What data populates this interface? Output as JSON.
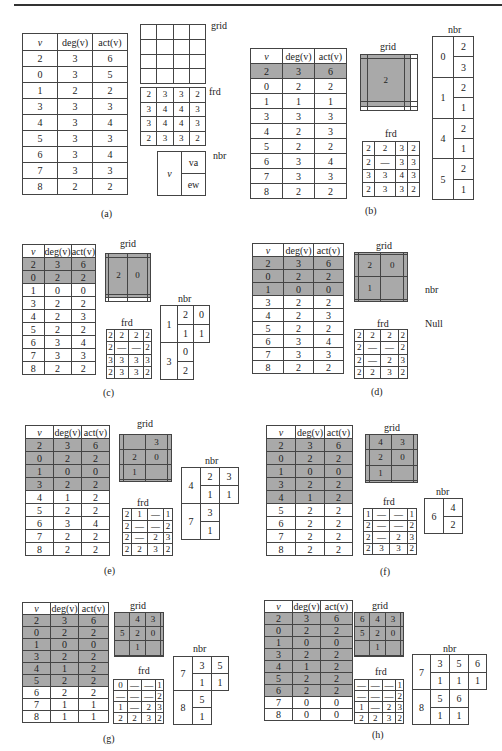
{
  "labels": {
    "grid": "grid",
    "frd": "frd",
    "nbr": "nbr",
    "null_text": "Null"
  },
  "table_header": {
    "v": "v",
    "deg": "deg(v)",
    "act": "act(v)"
  },
  "panels": {
    "a": {
      "caption": "(a)",
      "rows": [
        [
          "2",
          "3",
          "6"
        ],
        [
          "0",
          "3",
          "5"
        ],
        [
          "1",
          "2",
          "2"
        ],
        [
          "3",
          "3",
          "3"
        ],
        [
          "4",
          "3",
          "4"
        ],
        [
          "5",
          "3",
          "3"
        ],
        [
          "6",
          "3",
          "4"
        ],
        [
          "7",
          "3",
          "3"
        ],
        [
          "8",
          "2",
          "2"
        ]
      ],
      "selected_rows": 0,
      "grid": [
        [
          "",
          "",
          "",
          ""
        ],
        [
          "",
          "",
          "",
          ""
        ],
        [
          "",
          "",
          "",
          ""
        ],
        [
          "",
          "",
          "",
          ""
        ]
      ],
      "frd": [
        [
          "2",
          "3",
          "3",
          "2"
        ],
        [
          "3",
          "4",
          "4",
          "3"
        ],
        [
          "3",
          "4",
          "4",
          "3"
        ],
        [
          "2",
          "3",
          "3",
          "2"
        ]
      ],
      "nbr_legend": {
        "v": "v",
        "va": "va",
        "ew": "ew"
      }
    },
    "b": {
      "caption": "(b)",
      "rows": [
        [
          "2",
          "3",
          "6"
        ],
        [
          "0",
          "2",
          "2"
        ],
        [
          "1",
          "1",
          "1"
        ],
        [
          "3",
          "3",
          "3"
        ],
        [
          "4",
          "2",
          "3"
        ],
        [
          "5",
          "2",
          "2"
        ],
        [
          "6",
          "3",
          "4"
        ],
        [
          "7",
          "3",
          "3"
        ],
        [
          "8",
          "2",
          "2"
        ]
      ],
      "selected_rows": 1,
      "grid": [
        [
          "",
          "",
          "",
          ""
        ],
        [
          "",
          "2",
          "",
          ""
        ],
        [
          "",
          "",
          "",
          ""
        ],
        [
          "",
          "",
          "",
          ""
        ]
      ],
      "frd": [
        [
          "2",
          "2",
          "3",
          "2"
        ],
        [
          "2",
          "—",
          "3",
          "3"
        ],
        [
          "3",
          "3",
          "4",
          "3"
        ],
        [
          "2",
          "3",
          "3",
          "2"
        ]
      ],
      "nbr": [
        {
          "v": "0",
          "va": [
            "2"
          ],
          "ew": [
            "3"
          ]
        },
        {
          "v": "1",
          "va": [
            "2"
          ],
          "ew": [
            "1"
          ]
        },
        {
          "v": "4",
          "va": [
            "2"
          ],
          "ew": [
            "1"
          ]
        },
        {
          "v": "5",
          "va": [
            "2"
          ],
          "ew": [
            "1"
          ]
        }
      ]
    },
    "c": {
      "caption": "(c)",
      "rows": [
        [
          "2",
          "3",
          "6"
        ],
        [
          "0",
          "2",
          "2"
        ],
        [
          "1",
          "0",
          "0"
        ],
        [
          "3",
          "2",
          "2"
        ],
        [
          "4",
          "2",
          "3"
        ],
        [
          "5",
          "2",
          "2"
        ],
        [
          "6",
          "3",
          "4"
        ],
        [
          "7",
          "3",
          "3"
        ],
        [
          "8",
          "2",
          "2"
        ]
      ],
      "selected_rows": 2,
      "grid": [
        [
          "",
          "",
          "",
          ""
        ],
        [
          "",
          "2",
          "0",
          ""
        ],
        [
          "",
          "",
          "",
          ""
        ],
        [
          "",
          "",
          "",
          ""
        ]
      ],
      "frd": [
        [
          "2",
          "2",
          "2",
          "2"
        ],
        [
          "2",
          "—",
          "—",
          "2"
        ],
        [
          "3",
          "3",
          "3",
          "3"
        ],
        [
          "2",
          "3",
          "3",
          "2"
        ]
      ],
      "nbr": [
        {
          "v": "1",
          "va": [
            "2",
            "0"
          ],
          "ew": [
            "1",
            "1"
          ]
        },
        {
          "v": "3",
          "va": [
            "0"
          ],
          "ew": [
            "2"
          ]
        }
      ]
    },
    "d": {
      "caption": "(d)",
      "rows": [
        [
          "2",
          "3",
          "6"
        ],
        [
          "0",
          "2",
          "2"
        ],
        [
          "1",
          "0",
          "0"
        ],
        [
          "3",
          "2",
          "2"
        ],
        [
          "4",
          "2",
          "3"
        ],
        [
          "5",
          "2",
          "2"
        ],
        [
          "6",
          "3",
          "4"
        ],
        [
          "7",
          "3",
          "3"
        ],
        [
          "8",
          "2",
          "2"
        ]
      ],
      "selected_rows": 3,
      "grid": [
        [
          "",
          "",
          "",
          ""
        ],
        [
          "",
          "2",
          "0",
          ""
        ],
        [
          "",
          "1",
          "",
          ""
        ],
        [
          "",
          "",
          "",
          ""
        ]
      ],
      "frd": [
        [
          "2",
          "2",
          "2",
          "2"
        ],
        [
          "2",
          "—",
          "—",
          "2"
        ],
        [
          "2",
          "—",
          "2",
          "3"
        ],
        [
          "2",
          "2",
          "3",
          "2"
        ]
      ],
      "nbr_value": "Null"
    },
    "e": {
      "caption": "(e)",
      "rows": [
        [
          "2",
          "3",
          "6"
        ],
        [
          "0",
          "2",
          "2"
        ],
        [
          "1",
          "0",
          "0"
        ],
        [
          "3",
          "2",
          "2"
        ],
        [
          "4",
          "1",
          "2"
        ],
        [
          "5",
          "2",
          "2"
        ],
        [
          "6",
          "3",
          "4"
        ],
        [
          "7",
          "2",
          "2"
        ],
        [
          "8",
          "2",
          "2"
        ]
      ],
      "selected_rows": 4,
      "grid": [
        [
          "",
          "",
          "3",
          ""
        ],
        [
          "",
          "2",
          "0",
          ""
        ],
        [
          "",
          "1",
          "",
          ""
        ],
        [
          "",
          "",
          "",
          ""
        ]
      ],
      "frd": [
        [
          "2",
          "1",
          "—",
          "1"
        ],
        [
          "2",
          "—",
          "—",
          "2"
        ],
        [
          "2",
          "—",
          "2",
          "3"
        ],
        [
          "2",
          "2",
          "3",
          "2"
        ]
      ],
      "nbr": [
        {
          "v": "4",
          "va": [
            "2",
            "3"
          ],
          "ew": [
            "1",
            "1"
          ]
        },
        {
          "v": "7",
          "va": [
            "3"
          ],
          "ew": [
            "1"
          ]
        }
      ]
    },
    "f": {
      "caption": "(f)",
      "rows": [
        [
          "2",
          "3",
          "6"
        ],
        [
          "0",
          "2",
          "2"
        ],
        [
          "1",
          "0",
          "0"
        ],
        [
          "3",
          "2",
          "2"
        ],
        [
          "4",
          "1",
          "2"
        ],
        [
          "5",
          "2",
          "2"
        ],
        [
          "6",
          "2",
          "2"
        ],
        [
          "7",
          "2",
          "2"
        ],
        [
          "8",
          "2",
          "2"
        ]
      ],
      "selected_rows": 5,
      "grid": [
        [
          "",
          "4",
          "3",
          ""
        ],
        [
          "",
          "2",
          "0",
          ""
        ],
        [
          "",
          "1",
          "",
          ""
        ],
        [
          "",
          "",
          "",
          ""
        ]
      ],
      "frd": [
        [
          "1",
          "—",
          "—",
          "1"
        ],
        [
          "2",
          "—",
          "—",
          "2"
        ],
        [
          "2",
          "—",
          "2",
          "3"
        ],
        [
          "2",
          "3",
          "3",
          "2"
        ]
      ],
      "nbr": [
        {
          "v": "6",
          "va": [
            "4"
          ],
          "ew": [
            "2"
          ]
        }
      ]
    },
    "g": {
      "caption": "(g)",
      "rows": [
        [
          "2",
          "3",
          "6"
        ],
        [
          "0",
          "2",
          "2"
        ],
        [
          "1",
          "0",
          "0"
        ],
        [
          "3",
          "2",
          "2"
        ],
        [
          "4",
          "1",
          "2"
        ],
        [
          "5",
          "2",
          "2"
        ],
        [
          "6",
          "2",
          "2"
        ],
        [
          "7",
          "1",
          "1"
        ],
        [
          "8",
          "1",
          "1"
        ]
      ],
      "selected_rows": 6,
      "grid": [
        [
          "",
          "4",
          "3",
          ""
        ],
        [
          "5",
          "2",
          "0",
          ""
        ],
        [
          "",
          "1",
          "",
          ""
        ],
        [
          "",
          "",
          "",
          ""
        ]
      ],
      "frd": [
        [
          "0",
          "—",
          "—",
          "1"
        ],
        [
          "—",
          "—",
          "—",
          "2"
        ],
        [
          "1",
          "—",
          "2",
          "3"
        ],
        [
          "2",
          "2",
          "3",
          "2"
        ]
      ],
      "nbr": [
        {
          "v": "7",
          "va": [
            "3",
            "5"
          ],
          "ew": [
            "1",
            "1"
          ]
        },
        {
          "v": "8",
          "va": [
            "5"
          ],
          "ew": [
            "1"
          ]
        }
      ]
    },
    "h": {
      "caption": "(h)",
      "rows": [
        [
          "2",
          "3",
          "6"
        ],
        [
          "0",
          "2",
          "2"
        ],
        [
          "1",
          "0",
          "0"
        ],
        [
          "3",
          "2",
          "2"
        ],
        [
          "4",
          "1",
          "2"
        ],
        [
          "5",
          "2",
          "2"
        ],
        [
          "6",
          "2",
          "2"
        ],
        [
          "7",
          "0",
          "0"
        ],
        [
          "8",
          "0",
          "0"
        ]
      ],
      "selected_rows": 7,
      "grid": [
        [
          "6",
          "4",
          "3",
          ""
        ],
        [
          "5",
          "2",
          "0",
          ""
        ],
        [
          "",
          "1",
          "",
          ""
        ],
        [
          "",
          "",
          "",
          ""
        ]
      ],
      "frd": [
        [
          "—",
          "—",
          "—",
          "1"
        ],
        [
          "—",
          "—",
          "—",
          "2"
        ],
        [
          "1",
          "—",
          "2",
          "3"
        ],
        [
          "2",
          "2",
          "3",
          "2"
        ]
      ],
      "nbr": [
        {
          "v": "7",
          "va": [
            "3",
            "5",
            "6"
          ],
          "ew": [
            "1",
            "1",
            "1"
          ]
        },
        {
          "v": "8",
          "va": [
            "5",
            "6"
          ],
          "ew": [
            "1",
            "1"
          ]
        }
      ]
    }
  }
}
